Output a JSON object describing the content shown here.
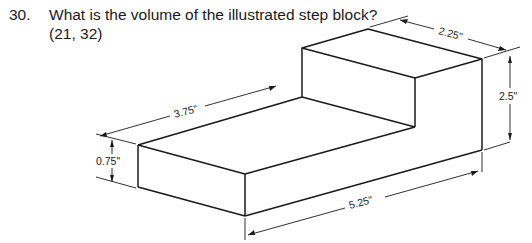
{
  "question": {
    "number": "30.",
    "text": "What is the volume of the illustrated step block?",
    "reference": "(21, 32)"
  },
  "figure": {
    "name": "step-block-isometric",
    "dimensions": {
      "top_depth": "2.25\"",
      "tall_height": "2.5\"",
      "step_length": "3.75\"",
      "base_height": "0.75\"",
      "total_length": "5.25\""
    }
  }
}
